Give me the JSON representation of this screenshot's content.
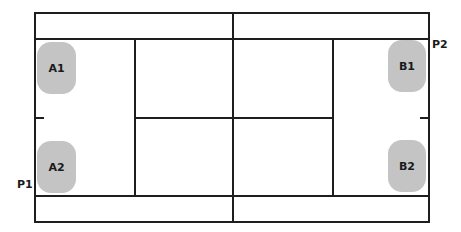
{
  "diagram": {
    "type": "badminton-doubles-court",
    "line_color": "#1e1e1e",
    "player_fill": "#c4c4c4",
    "side_labels": [
      {
        "id": "p1",
        "label": "P1"
      },
      {
        "id": "p2",
        "label": "P2"
      }
    ],
    "players": [
      {
        "id": "a1",
        "label": "A1",
        "team": "P1"
      },
      {
        "id": "a2",
        "label": "A2",
        "team": "P1"
      },
      {
        "id": "b1",
        "label": "B1",
        "team": "P2"
      },
      {
        "id": "b2",
        "label": "B2",
        "team": "P2"
      }
    ]
  }
}
